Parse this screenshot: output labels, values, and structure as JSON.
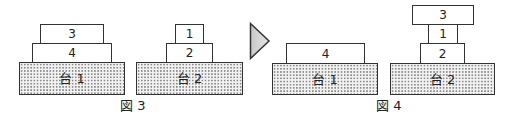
{
  "figures": [
    {
      "label": "図 3",
      "stands": [
        {
          "label": "台 1",
          "stack_bottom_to_top": [
            "4",
            "3"
          ]
        },
        {
          "label": "台 2",
          "stack_bottom_to_top": [
            "2",
            "1"
          ]
        }
      ]
    },
    {
      "label": "図 4",
      "stands": [
        {
          "label": "台 1",
          "stack_bottom_to_top": [
            "4"
          ]
        },
        {
          "label": "台 2",
          "stack_bottom_to_top": [
            "2",
            "1",
            "3"
          ]
        }
      ]
    }
  ],
  "transition_arrow": "right-arrow"
}
